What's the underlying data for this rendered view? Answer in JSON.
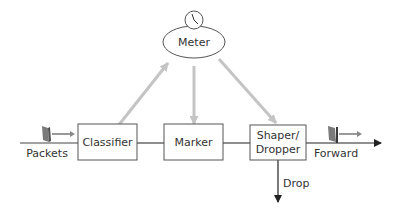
{
  "diagram": {
    "type": "traffic-conditioner",
    "nodes": {
      "meter": {
        "label": "Meter",
        "icon": "clock-icon"
      },
      "classifier": {
        "label": "Classifier"
      },
      "marker": {
        "label": "Marker"
      },
      "shaper": {
        "label_line1": "Shaper/",
        "label_line2": "Dropper"
      }
    },
    "edge_labels": {
      "input": "Packets",
      "output": "Forward",
      "drop": "Drop"
    },
    "colors": {
      "line": "#333333",
      "feedback_arrow": "#bbbbbb",
      "packet": "#777777",
      "box_border": "#555555"
    }
  }
}
